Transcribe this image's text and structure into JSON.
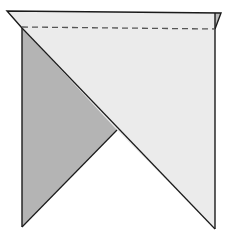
{
  "diagram": {
    "colors": {
      "background": "#ffffff",
      "light_face": "#ebebeb",
      "dark_face": "#b4b4b4",
      "small_flap": "#bdbdbd",
      "outline": "#1a1a1a",
      "fold_line": "#555555"
    },
    "fold_line_style": "dashed"
  }
}
